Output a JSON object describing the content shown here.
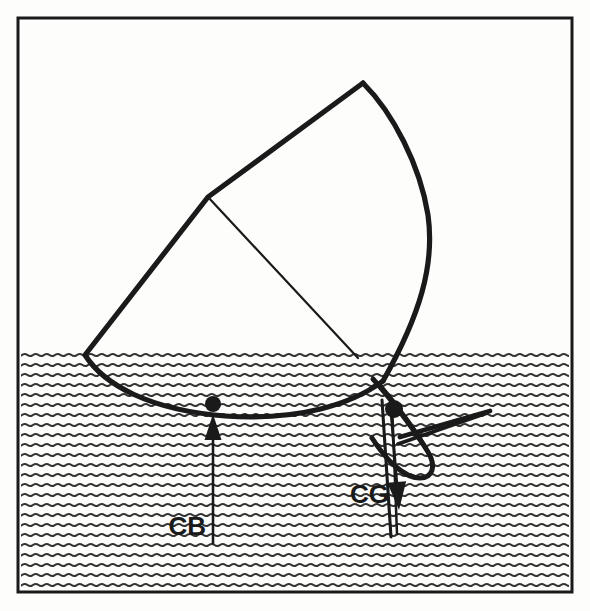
{
  "figure": {
    "kind": "naval-stability-diagram",
    "background_color": "#fdfdfc",
    "ink_color": "#1a1a1a",
    "water_color": "#333333",
    "frame": {
      "x": 18,
      "y": 18,
      "width": 554,
      "height": 574,
      "stroke_width": 3
    },
    "water": {
      "name": "water-hatching",
      "surface_y": 352,
      "bottom_y": 589,
      "left_x": 21,
      "right_x": 569,
      "wave_row_spacing": 10,
      "wave_length": 11,
      "wave_amplitude": 2.1,
      "wave_stroke_width": 2.0
    },
    "hull": {
      "name": "hull-outline",
      "stroke_width": 5.2,
      "deck_apex": {
        "x": 363,
        "y": 83
      },
      "deck_corner": {
        "x": 208,
        "y": 197
      },
      "port_waterline_entry": {
        "x": 85,
        "y": 355
      },
      "starboard_waterline_entry": {
        "x": 382,
        "y": 352
      },
      "keel_low_point": {
        "x": 225,
        "y": 416
      },
      "outline_path": "M 363 83 L 208 197 L 85 355 C 104 385 150 410 225 416 C 300 421 352 404 383 381",
      "topside_path": "M 363 83 C 393 113 420 165 428 215 C 435 265 420 315 383 381",
      "deck_line_path": "M 208 197 L 358 358",
      "deck_line_stroke_width": 2.2
    },
    "keel": {
      "name": "keel-and-rudder-assembly",
      "stroke_width": 5.0,
      "fin_path": "M 373 379 C 392 400 416 432 428 452 C 437 467 432 478 420 478 C 404 478 386 460 372 438",
      "fin_inner_path": "M 381 386 C 400 408 420 436 428 452",
      "rudder_upper_path": "M 400 437 L 490 411",
      "rudder_lower_path": "M 398 444 L 487 413",
      "rudder_tip": {
        "x": 491,
        "y": 409
      },
      "spike_outer_path": "M 382 400 L 391 537",
      "spike_inner_path": "M 392 402 L 397 534",
      "spike_tip": {
        "x": 391,
        "y": 537
      }
    },
    "markers": [
      {
        "name": "cb-point-marker",
        "label": "CB",
        "cx": 213,
        "cy": 404,
        "r": 8
      },
      {
        "name": "cg-point-marker",
        "label": "CG",
        "cx": 394,
        "cy": 409,
        "r": 9
      }
    ],
    "vectors": [
      {
        "name": "buoyancy-force-arrow",
        "label": "CB",
        "meaning": "Center of Buoyancy - buoyant force acts upward",
        "direction": "up",
        "tail": {
          "x": 213,
          "y": 544
        },
        "head": {
          "x": 213,
          "y": 414
        },
        "shaft_width": 2.6,
        "head_width": 17,
        "head_length": 26,
        "label_x": 206,
        "label_y": 535,
        "label_anchor": "end",
        "label_size": 26
      },
      {
        "name": "gravity-force-arrow",
        "label": "CG",
        "meaning": "Center of Gravity - weight acts downward",
        "direction": "down",
        "tail": {
          "x": 391,
          "y": 412
        },
        "head": {
          "x": 399,
          "y": 510
        },
        "shaft_width": 2.8,
        "head_width": 19,
        "head_length": 28,
        "label_x": 389,
        "label_y": 503,
        "label_anchor": "end",
        "label_size": 26
      }
    ]
  }
}
